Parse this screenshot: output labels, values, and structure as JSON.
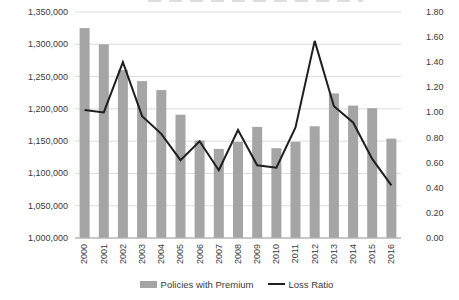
{
  "chart_data": {
    "type": "bar+line-combo",
    "categories": [
      "2000",
      "2001",
      "2002",
      "2003",
      "2004",
      "2005",
      "2006",
      "2007",
      "2008",
      "2009",
      "2010",
      "2011",
      "2012",
      "2013",
      "2014",
      "2015",
      "2016"
    ],
    "series": [
      {
        "name": "Policies with Premium",
        "type": "bar",
        "axis": "left",
        "color": "#a5a5a5",
        "values": [
          1325000,
          1300000,
          1260000,
          1243000,
          1229000,
          1191000,
          1151000,
          1138000,
          1149000,
          1172000,
          1139000,
          1149000,
          1173000,
          1224000,
          1205000,
          1201000,
          1154000
        ]
      },
      {
        "name": "Loss Ratio",
        "type": "line",
        "axis": "right",
        "color": "#1f1f1f",
        "values": [
          1.02,
          1.0,
          1.4,
          0.97,
          0.83,
          0.62,
          0.77,
          0.54,
          0.86,
          0.58,
          0.56,
          0.88,
          1.57,
          1.05,
          0.92,
          0.63,
          0.42
        ]
      }
    ],
    "left_axis": {
      "min": 1000000,
      "max": 1350000,
      "step": 50000,
      "tick_labels": [
        "1,350,000",
        "1,300,000",
        "1,250,000",
        "1,200,000",
        "1,150,000",
        "1,100,000",
        "1,050,000",
        "1,000,000"
      ]
    },
    "right_axis": {
      "min": 0.0,
      "max": 1.8,
      "step": 0.2,
      "tick_labels": [
        "1.80",
        "1.60",
        "1.40",
        "1.20",
        "1.00",
        "0.80",
        "0.60",
        "0.40",
        "0.20",
        "0.00"
      ]
    },
    "grid": true,
    "grid_color": "#dcdcdc",
    "axis_line_color": "#b5b5b5",
    "text_color": "#3a3a3a",
    "legend_position": "bottom"
  }
}
